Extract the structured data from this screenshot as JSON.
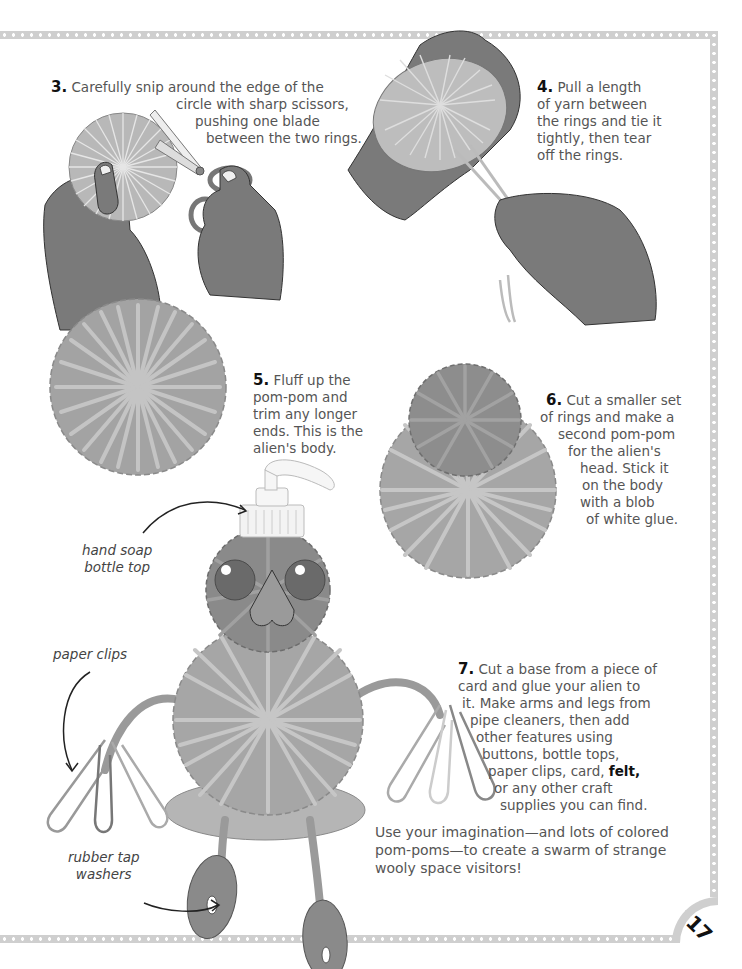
{
  "page_number": "17",
  "colors": {
    "border": "#cfcfcf",
    "skin": "#7a7a7a",
    "yarn": "#a9a9a9",
    "yarn_dark": "#8a8a8a",
    "text": "#555555",
    "step_number": "#111111"
  },
  "steps": [
    {
      "number": "3.",
      "lines": [
        "Carefully snip around the edge of the",
        "circle with sharp scissors,",
        "pushing one blade",
        "between the two rings."
      ]
    },
    {
      "number": "4.",
      "lines": [
        "Pull a length",
        "of yarn between",
        "the rings and tie it",
        "tightly, then tear",
        "off the rings."
      ]
    },
    {
      "number": "5.",
      "lines": [
        "Fluff up the",
        "pom-pom and",
        "trim any longer",
        "ends. This is the",
        "alien's body."
      ]
    },
    {
      "number": "6.",
      "lines": [
        "Cut a smaller set",
        "of rings and make a",
        "second pom-pom",
        "for the alien's",
        "head. Stick it",
        "on the body",
        "with a blob",
        "of white glue."
      ]
    },
    {
      "number": "7.",
      "lines": [
        "Cut a base from a piece of",
        "card and glue your alien to",
        "it. Make arms and legs from",
        "pipe cleaners, then add",
        "other features using",
        "buttons, bottle tops,",
        "paper clips, card,",
        "or any other craft",
        "supplies you can find."
      ],
      "bold_word": "felt,"
    }
  ],
  "closing_text": [
    "Use your imagination—and lots of colored",
    "pom-poms—to create a swarm of strange",
    "wooly space visitors!"
  ],
  "labels": {
    "hand_soap": [
      "hand soap",
      "bottle top"
    ],
    "paper_clips": "paper clips",
    "tap_washers": [
      "rubber tap",
      "washers"
    ]
  },
  "illustrations": [
    "hands-cutting-pompom-with-scissors",
    "hands-tying-yarn-on-rings",
    "fluffed-pompom-body",
    "pompom-head-on-body",
    "finished-pompom-alien"
  ]
}
